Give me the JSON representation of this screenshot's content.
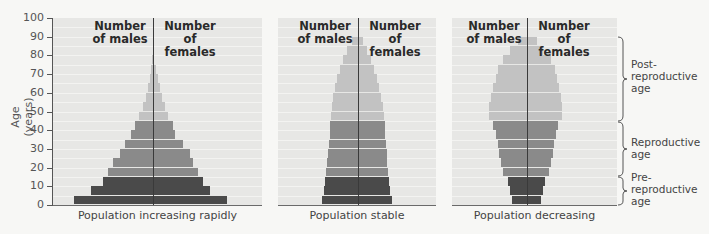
{
  "chart_data": {
    "type": "bar",
    "subtype": "population-pyramid",
    "title": "",
    "ylabel": "Age (years)",
    "ylim": [
      0,
      100
    ],
    "yticks": [
      0,
      10,
      20,
      30,
      40,
      50,
      60,
      70,
      80,
      90,
      100
    ],
    "bin_size_years": 5,
    "column_headers": {
      "left": "Number of males",
      "right": "Number of females"
    },
    "age_groups": [
      {
        "label": "Pre-reproductive age",
        "from": 0,
        "to": 15,
        "color": "#4a4a4a"
      },
      {
        "label": "Reproductive age",
        "from": 15,
        "to": 45,
        "color": "#8a8a8a"
      },
      {
        "label": "Post-reproductive age",
        "from": 45,
        "to": 90,
        "color": "#c2c2c2"
      }
    ],
    "panels": [
      {
        "caption": "Population increasing rapidly",
        "center_x": 153,
        "males": [
          79,
          62,
          50,
          45,
          40,
          33,
          28,
          22,
          18,
          14,
          10,
          7,
          5,
          3,
          2,
          1
        ],
        "females": [
          74,
          57,
          50,
          45,
          40,
          37,
          30,
          22,
          20,
          15,
          12,
          9,
          7,
          5,
          3,
          1
        ]
      },
      {
        "caption": "Population stable",
        "center_x": 358,
        "males": [
          36,
          34,
          33,
          32,
          31,
          30,
          29,
          28,
          28,
          27,
          26,
          25,
          23,
          21,
          18,
          15,
          11,
          6
        ],
        "females": [
          34,
          32,
          31,
          30,
          29,
          29,
          28,
          27,
          27,
          26,
          25,
          23,
          21,
          19,
          16,
          13,
          9,
          5
        ]
      },
      {
        "caption": "Population decreasing",
        "center_x": 527,
        "males": [
          15,
          17,
          19,
          24,
          26,
          28,
          29,
          31,
          34,
          38,
          38,
          36,
          34,
          31,
          29,
          24,
          17,
          9
        ],
        "females": [
          14,
          16,
          18,
          22,
          24,
          26,
          27,
          29,
          31,
          35,
          35,
          34,
          32,
          30,
          28,
          24,
          16,
          10
        ]
      }
    ],
    "note": "Bar values are relative half-widths in pixels (no numeric x-axis shown)."
  },
  "labels": {
    "ylabel": "Age (years)",
    "header_males_1": "Number",
    "header_males_2": "of males",
    "header_females_1": "Number",
    "header_females_2": "of females",
    "captions": [
      "Population increasing rapidly",
      "Population stable",
      "Population decreasing"
    ],
    "brackets": {
      "post": [
        "Post-",
        "reproductive",
        "age"
      ],
      "repro": [
        "Reproductive",
        "age"
      ],
      "pre": [
        "Pre-",
        "reproductive",
        "age"
      ]
    }
  }
}
